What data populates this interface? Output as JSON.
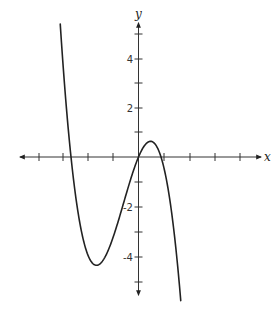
{
  "chart_data": {
    "type": "line",
    "title": "",
    "xlabel": "x",
    "ylabel": "y",
    "xlim": [
      -4,
      5
    ],
    "ylim": [
      -5.5,
      5.5
    ],
    "grid": false,
    "x_ticks": [
      -4,
      -3,
      -2,
      -1,
      1,
      2,
      3,
      4
    ],
    "y_ticks": [
      -5,
      -4,
      -3,
      -2,
      -1,
      1,
      2,
      3,
      4,
      5
    ],
    "y_tick_labels": [
      {
        "value": 4,
        "label": "4"
      },
      {
        "value": 2,
        "label": "2"
      },
      {
        "value": -2,
        "label": "-2"
      },
      {
        "value": -4,
        "label": "-4"
      }
    ],
    "series": [
      {
        "name": "cubic",
        "description": "cubic polynomial with negative leading coefficient",
        "roots": [
          -2.7,
          0,
          0.9
        ],
        "local_min": {
          "x": -1.7,
          "y": -4.3
        },
        "local_max": {
          "x": 0.45,
          "y": 0.5
        },
        "x": [
          -3.13,
          -3.0,
          -2.7,
          -2.5,
          -2.0,
          -1.7,
          -1.5,
          -1.0,
          -0.5,
          0,
          0.45,
          0.9,
          1.2,
          1.5,
          1.69
        ],
        "y": [
          5.4,
          3.5,
          0,
          -1.7,
          -4.06,
          -4.42,
          -4.2,
          -3.4,
          -1.8,
          0,
          0.6,
          0,
          -1.4,
          -3.6,
          -5.8
        ]
      }
    ]
  },
  "axes": {
    "x_label": "x",
    "y_label": "y",
    "labels": {
      "y4": "4",
      "y2": "2",
      "yn2": "-2",
      "yn4": "-4"
    }
  }
}
